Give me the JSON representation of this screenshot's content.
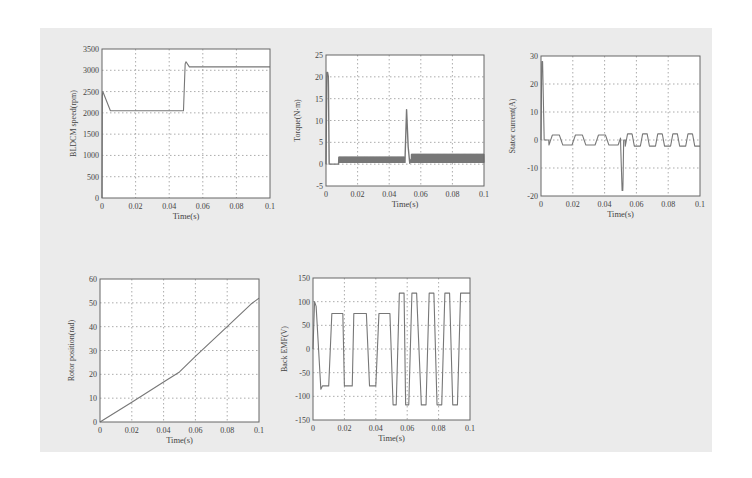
{
  "figure": {
    "background": "#ebebeb",
    "line_color": "#777777",
    "grid_color": "#888888"
  },
  "chart_data": [
    {
      "id": "speed",
      "type": "line",
      "title": "",
      "xlabel": "Time(s)",
      "ylabel": "BLDCM speed(rpm)",
      "xlim": [
        0,
        0.1
      ],
      "ylim": [
        0,
        3500
      ],
      "xticks": [
        "0",
        "0.02",
        "0.04",
        "0.06",
        "0.08",
        "0.1"
      ],
      "yticks": [
        "0",
        "500",
        "1000",
        "1500",
        "2000",
        "2500",
        "3000",
        "3500"
      ],
      "grid": true,
      "x": [
        0,
        0.0002,
        0.0005,
        0.001,
        0.005,
        0.0485,
        0.0495,
        0.05,
        0.052,
        0.1
      ],
      "y": [
        0,
        2400,
        2500,
        2450,
        2050,
        2050,
        3150,
        3200,
        3080,
        3080
      ]
    },
    {
      "id": "torque",
      "type": "line",
      "title": "",
      "xlabel": "Time(s)",
      "ylabel": "Torque(N·m)",
      "xlim": [
        0,
        0.1
      ],
      "ylim": [
        -5,
        25
      ],
      "xticks": [
        "0",
        "0.02",
        "0.04",
        "0.06",
        "0.08",
        "0.1"
      ],
      "yticks": [
        "-5",
        "0",
        "5",
        "10",
        "15",
        "20",
        "25"
      ],
      "grid": true,
      "x": [
        0,
        0.0005,
        0.001,
        0.0015,
        0.002,
        0.008,
        0.009,
        0.05,
        0.051,
        0.052,
        0.053,
        0.054,
        0.1
      ],
      "y": [
        0,
        21,
        21,
        20,
        0,
        0,
        1,
        1,
        12.5,
        4,
        0.2,
        1.3,
        1.3
      ],
      "ripple": [
        {
          "from": 0.008,
          "to": 0.05,
          "amplitude": 0.6,
          "center": 1
        },
        {
          "from": 0.054,
          "to": 0.1,
          "amplitude": 0.9,
          "center": 1.3
        }
      ]
    },
    {
      "id": "stator-current",
      "type": "line",
      "title": "",
      "xlabel": "Time(s)",
      "ylabel": "Stator current(A)",
      "xlim": [
        0,
        0.1
      ],
      "ylim": [
        -20,
        30
      ],
      "xticks": [
        "0",
        "0.02",
        "0.04",
        "0.06",
        "0.08",
        "0.1"
      ],
      "yticks": [
        "-20",
        "-10",
        "0",
        "10",
        "20",
        "30"
      ],
      "grid": true,
      "x": [
        0,
        0.0005,
        0.001,
        0.002,
        0.05,
        0.051,
        0.0515,
        0.052,
        0.1
      ],
      "y": [
        0,
        28,
        28,
        0,
        0,
        -18,
        -18,
        0,
        0
      ],
      "square_wave": [
        {
          "from": 0.005,
          "to": 0.05,
          "amplitude": 1.8,
          "period": 0.0145
        },
        {
          "from": 0.053,
          "to": 0.1,
          "amplitude": 2.2,
          "period": 0.0095
        }
      ]
    },
    {
      "id": "rotor-position",
      "type": "line",
      "title": "",
      "xlabel": "Time(s)",
      "ylabel": "Rotor position(rad)",
      "xlim": [
        0,
        0.1
      ],
      "ylim": [
        0,
        60
      ],
      "xticks": [
        "0",
        "0.02",
        "0.04",
        "0.06",
        "0.08",
        "0.1"
      ],
      "yticks": [
        "0",
        "10",
        "20",
        "30",
        "40",
        "50",
        "60"
      ],
      "grid": true,
      "x": [
        0,
        0.02,
        0.04,
        0.05,
        0.06,
        0.08,
        0.095,
        0.1
      ],
      "y": [
        0,
        8.3,
        16.8,
        21,
        27.5,
        40,
        49.5,
        52
      ]
    },
    {
      "id": "back-emf",
      "type": "line",
      "title": "",
      "xlabel": "Time(s)",
      "ylabel": "Back EMF(V)",
      "xlim": [
        0,
        0.1
      ],
      "ylim": [
        -150,
        150
      ],
      "xticks": [
        "0",
        "0.02",
        "0.04",
        "0.06",
        "0.08",
        "0.1"
      ],
      "yticks": [
        "-150",
        "-100",
        "-50",
        "0",
        "50",
        "100",
        "150"
      ],
      "grid": true,
      "x": [
        0,
        0.001,
        0.002,
        0.005,
        0.006,
        0.01,
        0.012,
        0.015,
        0.019,
        0.02,
        0.025,
        0.026,
        0.03,
        0.034,
        0.036,
        0.04,
        0.042,
        0.045,
        0.049,
        0.051,
        0.053,
        0.055,
        0.058,
        0.059,
        0.061,
        0.063,
        0.064,
        0.066,
        0.069,
        0.07,
        0.072,
        0.074,
        0.075,
        0.077,
        0.079,
        0.08,
        0.082,
        0.084,
        0.085,
        0.087,
        0.089,
        0.09,
        0.092,
        0.094,
        0.095,
        0.097,
        0.099,
        0.1
      ],
      "y": [
        0,
        100,
        90,
        -85,
        -78,
        -78,
        75,
        75,
        75,
        -78,
        -78,
        75,
        75,
        75,
        -78,
        -78,
        75,
        75,
        75,
        -118,
        -118,
        118,
        118,
        -118,
        -118,
        118,
        118,
        118,
        -118,
        -118,
        -118,
        118,
        118,
        118,
        -118,
        -118,
        -118,
        118,
        118,
        118,
        -118,
        -118,
        -118,
        118,
        118,
        118,
        118,
        118
      ]
    }
  ]
}
